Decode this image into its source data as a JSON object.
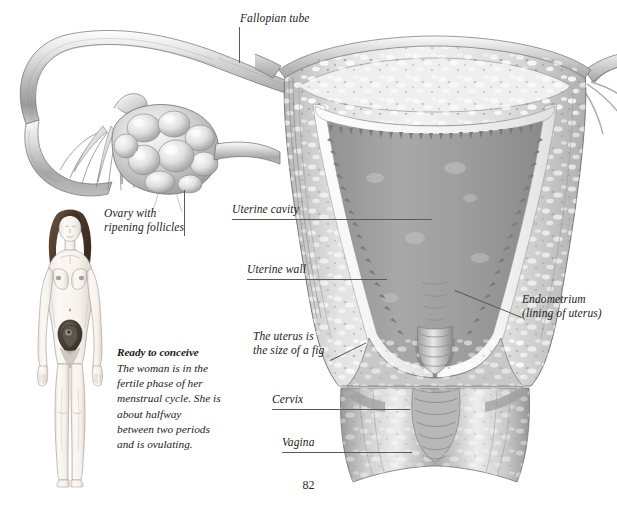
{
  "page": {
    "number": "82",
    "background_color": "#ffffff",
    "ink_color": "#1c1c1c",
    "leader_color": "#5a5a5a"
  },
  "illustration": {
    "name": "female-reproductive-system-cross-section",
    "description": "Pencil-rendered anatomical illustration of the uterus in coronal cross-section with fallopian tubes and ovary, plus a full-body female figure",
    "parts": [
      "fallopian-tube",
      "fimbriae",
      "ovary-with-ripening-follicles",
      "uterine-fundus",
      "uterine-cavity",
      "uterine-wall-myometrium",
      "endometrium",
      "cervix",
      "cervical-canal",
      "vagina"
    ]
  },
  "labels": [
    {
      "id": "fallopian-tube",
      "text": "Fallopian tube"
    },
    {
      "id": "ovary",
      "line1": "Ovary with",
      "line2": "ripening follicles"
    },
    {
      "id": "uterine-cavity",
      "text": "Uterine cavity"
    },
    {
      "id": "uterine-wall",
      "text": "Uterine wall"
    },
    {
      "id": "endometrium",
      "line1": "Endometrium",
      "line2": "(lining of uterus)"
    },
    {
      "id": "fig-size",
      "line1": "The uterus is",
      "line2": "the size of a fig"
    },
    {
      "id": "cervix",
      "text": "Cervix"
    },
    {
      "id": "vagina",
      "text": "Vagina"
    }
  ],
  "caption": {
    "title": "Ready to conceive",
    "body": "The woman is in the fertile phase of her menstrual cycle. She is about halfway between two periods and is ovulating."
  },
  "figure": {
    "name": "standing-female-figure",
    "hair_color": "#4a3527",
    "skin_color": "#f7f1ec",
    "highlight": "uterus-position-marker"
  }
}
